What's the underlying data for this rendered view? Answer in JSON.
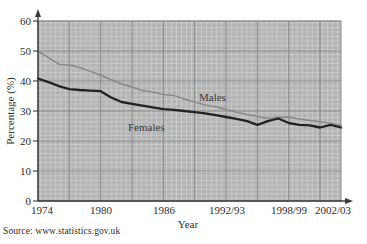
{
  "source_note": "Source: www.statistics.gov.uk",
  "axes": {
    "y_title": "Percentage (%)",
    "x_title": "Year",
    "y_ticks": [
      "0",
      "10",
      "20",
      "30",
      "40",
      "50",
      "60"
    ],
    "x_ticks": [
      "1974",
      "1980",
      "1986",
      "1992/93",
      "1998/99",
      "2002/03"
    ]
  },
  "labels": {
    "males": "Males",
    "females": "Females"
  },
  "colors": {
    "plot_background": "#b6b6b6",
    "minor_grid": "#d8d8d8",
    "major_grid": "#7d7d7d",
    "males_line": "#8a8a8a",
    "females_line": "#222222",
    "axis": "#3a3a3a",
    "text": "#2b2b2b"
  },
  "chart_data": {
    "type": "line",
    "title": "",
    "xlabel": "Year",
    "ylabel": "Percentage (%)",
    "xlim": [
      1974,
      2003
    ],
    "ylim": [
      0,
      60
    ],
    "grid": true,
    "legend": "inline-annotations",
    "x_tick_values": [
      1974,
      1980,
      1986,
      1992,
      1998,
      2002
    ],
    "x_tick_labels": [
      "1974",
      "1980",
      "1986",
      "1992/93",
      "1998/99",
      "2002/03"
    ],
    "y_tick_values": [
      0,
      10,
      20,
      30,
      40,
      50,
      60
    ],
    "x": [
      1974,
      1975,
      1976,
      1977,
      1978,
      1979,
      1980,
      1981,
      1982,
      1983,
      1984,
      1985,
      1986,
      1987,
      1988,
      1989,
      1990,
      1991,
      1992,
      1993,
      1994,
      1995,
      1996,
      1997,
      1998,
      1999,
      2000,
      2001,
      2002,
      2003
    ],
    "series": [
      {
        "name": "Males",
        "color": "#8a8a8a",
        "values": [
          50.0,
          47.8,
          45.6,
          45.3,
          44.5,
          43.2,
          42.0,
          40.4,
          39.0,
          38.0,
          36.8,
          36.3,
          35.5,
          35.2,
          34.0,
          33.0,
          32.0,
          31.4,
          30.5,
          29.6,
          28.8,
          28.2,
          27.6,
          27.9,
          28.0,
          27.3,
          26.8,
          26.4,
          26.0,
          25.2
        ]
      },
      {
        "name": "Females",
        "color": "#222222",
        "values": [
          40.8,
          39.6,
          38.3,
          37.3,
          37.0,
          36.8,
          36.6,
          34.5,
          33.0,
          32.4,
          31.8,
          31.2,
          30.6,
          30.4,
          30.0,
          29.6,
          29.2,
          28.6,
          28.0,
          27.4,
          26.6,
          25.4,
          26.6,
          27.5,
          26.0,
          25.4,
          25.2,
          24.5,
          25.4,
          24.5
        ]
      }
    ],
    "annotations": [
      {
        "text": "Males",
        "x": 1990,
        "y": 34.5
      },
      {
        "text": "Females",
        "x": 1983.5,
        "y": 26.3
      }
    ]
  }
}
